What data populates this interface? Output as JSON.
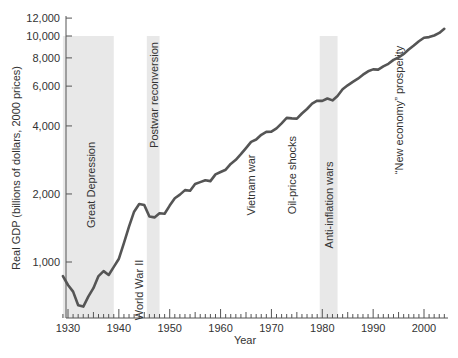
{
  "chart_data": {
    "type": "line",
    "title": "",
    "xlabel": "Year",
    "ylabel": "Real GDP (billions of dollars, 2000 prices)",
    "yscale": "log",
    "xlim": [
      1929,
      2005
    ],
    "ylim": [
      600,
      12500
    ],
    "xticks": [
      1930,
      1940,
      1950,
      1960,
      1970,
      1980,
      1990,
      2000
    ],
    "yticks": [
      1000,
      2000,
      4000,
      6000,
      8000,
      10000,
      12000
    ],
    "ytick_labels": [
      "1,000",
      "2,000",
      "4,000",
      "6,000",
      "8,000",
      "10,000",
      "12,000"
    ],
    "grid": false,
    "line_color": "#555555",
    "band_color": "#e8e8e8",
    "series": [
      {
        "name": "Real GDP",
        "x": [
          1929,
          1930,
          1931,
          1932,
          1933,
          1934,
          1935,
          1936,
          1937,
          1938,
          1939,
          1940,
          1941,
          1942,
          1943,
          1944,
          1945,
          1946,
          1947,
          1948,
          1949,
          1950,
          1951,
          1952,
          1953,
          1954,
          1955,
          1956,
          1957,
          1958,
          1959,
          1960,
          1961,
          1962,
          1963,
          1964,
          1965,
          1966,
          1967,
          1968,
          1969,
          1970,
          1971,
          1972,
          1973,
          1974,
          1975,
          1976,
          1977,
          1978,
          1979,
          1980,
          1981,
          1982,
          1983,
          1984,
          1985,
          1986,
          1987,
          1988,
          1989,
          1990,
          1991,
          1992,
          1993,
          1994,
          1995,
          1996,
          1997,
          1998,
          1999,
          2000,
          2001,
          2002,
          2003,
          2004
        ],
        "values": [
          865,
          791,
          740,
          643,
          635,
          703,
          766,
          866,
          911,
          876,
          951,
          1034,
          1211,
          1435,
          1670,
          1806,
          1786,
          1589,
          1575,
          1644,
          1635,
          1777,
          1915,
          1988,
          2080,
          2065,
          2213,
          2256,
          2301,
          2279,
          2441,
          2502,
          2560,
          2716,
          2834,
          2999,
          3191,
          3399,
          3485,
          3653,
          3765,
          3772,
          3899,
          4105,
          4342,
          4320,
          4311,
          4541,
          4751,
          5015,
          5173,
          5161,
          5292,
          5189,
          5424,
          5814,
          6054,
          6264,
          6475,
          6743,
          6981,
          7113,
          7100,
          7337,
          7533,
          7836,
          8032,
          8329,
          8704,
          9067,
          9470,
          9817,
          9891,
          10049,
          10321,
          10756
        ]
      }
    ],
    "shaded_periods": [
      {
        "label": "Great Depression",
        "start": 1929,
        "end": 1939
      },
      {
        "label": "Postwar reconversion",
        "start": 1945.5,
        "end": 1948
      },
      {
        "label": "Anti-inflation wars",
        "start": 1979.5,
        "end": 1983
      }
    ],
    "annotations": [
      {
        "label": "Great Depression",
        "x": 1934.5,
        "y_px": 185
      },
      {
        "label": "World War II",
        "x": 1944,
        "y_px": 290
      },
      {
        "label": "Postwar reconversion",
        "x": 1947,
        "y_px": 95
      },
      {
        "label": "Vietnam war",
        "x": 1966,
        "y_px": 185
      },
      {
        "label": "Oil-price shocks",
        "x": 1974,
        "y_px": 175
      },
      {
        "label": "Anti-inflation wars",
        "x": 1981.3,
        "y_px": 205
      },
      {
        "label": "“New economy” prosperity",
        "x": 1995,
        "y_px": 110
      }
    ]
  }
}
